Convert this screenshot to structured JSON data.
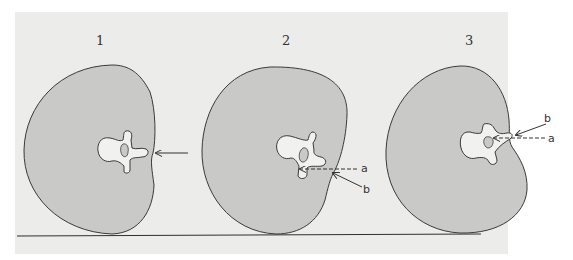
{
  "figure": {
    "panels": [
      {
        "number": "1",
        "labels": []
      },
      {
        "number": "2",
        "labels": {
          "a": "a",
          "b": "b"
        }
      },
      {
        "number": "3",
        "labels": {
          "a": "a",
          "b": "b"
        }
      }
    ]
  },
  "colors": {
    "paper": "#ececea",
    "body_fill": "#c9c9c7",
    "outline": "#3a3a3a",
    "vertebra_fill": "#f1f1ef",
    "ground_line": "#2e2e2e"
  }
}
